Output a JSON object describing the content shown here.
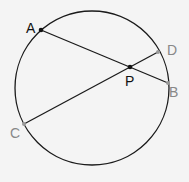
{
  "diagram": {
    "type": "intersecting-chords-in-circle",
    "background": "#f4f4f4",
    "circle": {
      "cx": 92,
      "cy": 88,
      "r": 77,
      "stroke": "#1a1a1a"
    },
    "points": {
      "A": {
        "label": "A",
        "x": 41,
        "y": 30,
        "color": "#111111"
      },
      "B": {
        "label": "B",
        "x": 168,
        "y": 83,
        "color": "#888888"
      },
      "C": {
        "label": "C",
        "x": 24,
        "y": 124,
        "color": "#888888"
      },
      "D": {
        "label": "D",
        "x": 158,
        "y": 52,
        "color": "#888888"
      },
      "P": {
        "label": "P",
        "x": 130,
        "y": 67,
        "color": "#111111"
      }
    },
    "chords": [
      {
        "name": "AB",
        "from": "A",
        "to": "B"
      },
      {
        "name": "CD",
        "from": "C",
        "to": "D"
      }
    ]
  }
}
